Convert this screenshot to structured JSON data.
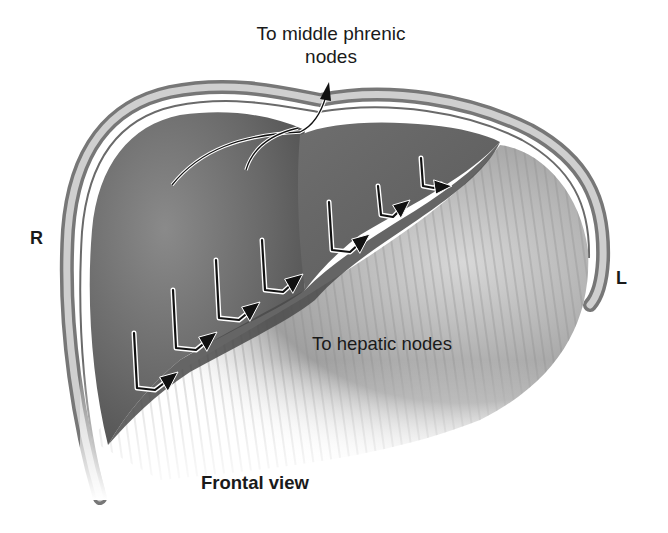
{
  "figure": {
    "type": "anatomical-illustration",
    "palette": {
      "background": "#ffffff",
      "capsule_outer": "#7a7a7a",
      "capsule_band": "#c8c8c8",
      "liver_dark": "#5e5e5e",
      "liver_mid": "#7c7c7c",
      "diaphragm_fibers": "#9a9a9a",
      "arrow": "#111111",
      "arrow_halo": "#ffffff",
      "text": "#1a1a1a"
    }
  },
  "labels": {
    "top_line1": "To middle phrenic",
    "top_line2": "nodes",
    "hepatic": "To hepatic nodes",
    "view": "Frontal view",
    "right_side": "R",
    "left_side": "L"
  },
  "arrows": {
    "phrenic_count": 2,
    "hepatic_count": 7,
    "hepatic_direction": "down then right toward inferior border"
  }
}
